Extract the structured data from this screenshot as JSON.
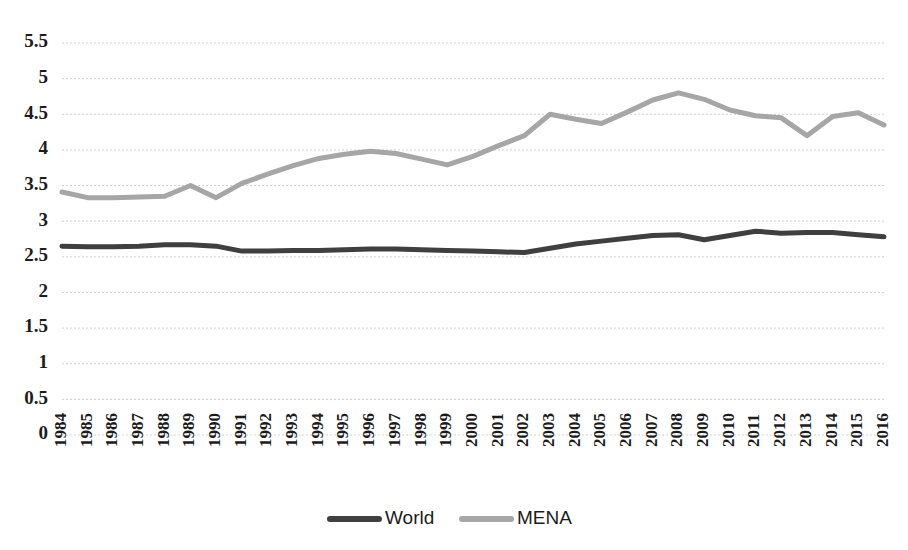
{
  "chart_data": {
    "type": "line",
    "title": "",
    "subtitle": "",
    "xlabel": "",
    "ylabel": "",
    "grid": true,
    "legend_position": "bottom",
    "ylim": [
      0,
      5.5
    ],
    "yticks": [
      "0",
      "0.5",
      "1",
      "1.5",
      "2",
      "2.5",
      "3",
      "3.5",
      "4",
      "4.5",
      "5",
      "5.5"
    ],
    "ytick_values": [
      0,
      0.5,
      1,
      1.5,
      2,
      2.5,
      3,
      3.5,
      4,
      4.5,
      5,
      5.5
    ],
    "categories": [
      "1984",
      "1985",
      "1986",
      "1987",
      "1988",
      "1989",
      "1990",
      "1991",
      "1992",
      "1993",
      "1994",
      "1995",
      "1996",
      "1997",
      "1998",
      "1999",
      "2000",
      "2001",
      "2002",
      "2003",
      "2004",
      "2005",
      "2006",
      "2007",
      "2008",
      "2009",
      "2010",
      "2011",
      "2012",
      "2013",
      "2014",
      "2015",
      "2016"
    ],
    "series": [
      {
        "name": "World",
        "color": "#3f3f3f",
        "width": 5,
        "values": [
          2.65,
          2.64,
          2.64,
          2.65,
          2.67,
          2.67,
          2.65,
          2.58,
          2.58,
          2.59,
          2.59,
          2.6,
          2.61,
          2.61,
          2.6,
          2.59,
          2.58,
          2.57,
          2.56,
          2.62,
          2.68,
          2.72,
          2.76,
          2.8,
          2.81,
          2.74,
          2.8,
          2.86,
          2.83,
          2.84,
          2.84,
          2.81,
          2.78
        ]
      },
      {
        "name": "MENA",
        "color": "#a6a6a6",
        "width": 5,
        "values": [
          3.41,
          3.33,
          3.33,
          3.34,
          3.35,
          3.5,
          3.33,
          3.53,
          3.66,
          3.78,
          3.88,
          3.94,
          3.98,
          3.95,
          3.87,
          3.79,
          3.91,
          4.06,
          4.2,
          4.5,
          4.43,
          4.37,
          4.53,
          4.7,
          4.8,
          4.71,
          4.56,
          4.48,
          4.45,
          4.2,
          4.47,
          4.52,
          4.35
        ]
      }
    ]
  },
  "legend": {
    "items": [
      {
        "label": "World",
        "color": "#3f3f3f"
      },
      {
        "label": "MENA",
        "color": "#a6a6a6"
      }
    ]
  },
  "colors": {
    "world": "#3f3f3f",
    "mena": "#a6a6a6",
    "grid": "#c9c9c9",
    "text": "#1c1c1c",
    "background": "#ffffff"
  }
}
